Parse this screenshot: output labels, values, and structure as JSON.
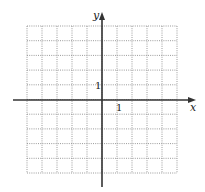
{
  "diagram": {
    "type": "coordinate-grid",
    "axes": {
      "x_label": "x",
      "y_label": "y",
      "x_tick_label": "1",
      "y_tick_label": "1"
    },
    "grid": {
      "columns": 10,
      "rows": 10,
      "x_range": [
        -5,
        5
      ],
      "y_range": [
        -5,
        5
      ],
      "line_style": "dotted",
      "grid_color": "#9a9a9a",
      "axis_color": "#333333"
    }
  }
}
